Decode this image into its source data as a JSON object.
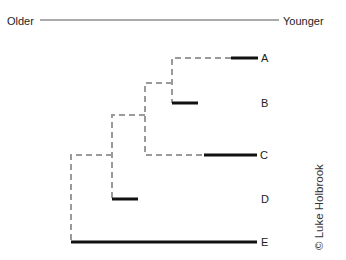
{
  "axis": {
    "left_label": "Older",
    "right_label": "Younger"
  },
  "taxa": [
    {
      "label": "A"
    },
    {
      "label": "B"
    },
    {
      "label": "C"
    },
    {
      "label": "D"
    },
    {
      "label": "E"
    }
  ],
  "copyright": "© Luke Holbrook",
  "colors": {
    "ghost_lineage": "#9a9a9a",
    "observed_range": "#111111",
    "axis_line": "#555555"
  }
}
